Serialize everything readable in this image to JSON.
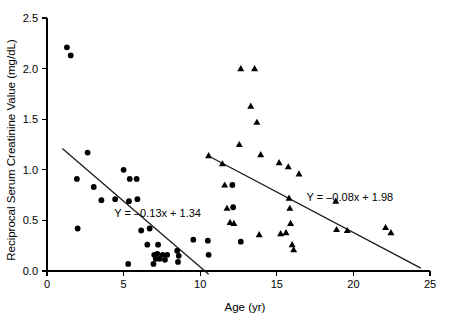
{
  "chart_data": {
    "type": "scatter",
    "title": "",
    "xlabel": "Age (yr)",
    "ylabel": "Reciprocal Serum Creatinine Value (mg/dL)",
    "xlim": [
      0,
      25
    ],
    "ylim": [
      0.0,
      2.5
    ],
    "xticks": [
      0,
      5,
      10,
      15,
      20,
      25
    ],
    "xtick_labels": [
      "0",
      "5",
      "10",
      "15",
      "20",
      "25"
    ],
    "yticks": [
      0.0,
      0.5,
      1.0,
      1.5,
      2.0,
      2.5
    ],
    "ytick_labels": [
      "0.0",
      "0.5",
      "1.0",
      "1.5",
      "2.0",
      "2.5"
    ],
    "grid": false,
    "legend": "none",
    "series": [
      {
        "name": "early-group-circles",
        "marker": "circle",
        "color": "#000000",
        "points": [
          [
            1.3,
            2.21
          ],
          [
            1.55,
            2.13
          ],
          [
            1.95,
            0.91
          ],
          [
            2.0,
            0.42
          ],
          [
            2.65,
            1.17
          ],
          [
            3.05,
            0.83
          ],
          [
            3.55,
            0.7
          ],
          [
            4.45,
            0.71
          ],
          [
            5.0,
            1.0
          ],
          [
            5.3,
            0.07
          ],
          [
            5.35,
            0.69
          ],
          [
            5.4,
            0.91
          ],
          [
            5.85,
            0.91
          ],
          [
            5.9,
            0.71
          ],
          [
            6.15,
            0.4
          ],
          [
            6.55,
            0.26
          ],
          [
            6.7,
            0.42
          ],
          [
            6.95,
            0.07
          ],
          [
            7.0,
            0.16
          ],
          [
            7.1,
            0.12
          ],
          [
            7.2,
            0.17
          ],
          [
            7.25,
            0.26
          ],
          [
            7.35,
            0.12
          ],
          [
            7.55,
            0.16
          ],
          [
            7.7,
            0.11
          ],
          [
            7.85,
            0.16
          ],
          [
            8.5,
            0.2
          ],
          [
            8.55,
            0.09
          ],
          [
            8.6,
            0.15
          ],
          [
            9.55,
            0.31
          ],
          [
            10.5,
            0.3
          ],
          [
            10.55,
            0.16
          ],
          [
            12.1,
            0.85
          ],
          [
            12.15,
            0.63
          ],
          [
            12.65,
            0.29
          ]
        ]
      },
      {
        "name": "late-group-triangles",
        "marker": "triangle",
        "color": "#000000",
        "points": [
          [
            10.55,
            1.14
          ],
          [
            11.45,
            1.06
          ],
          [
            11.6,
            0.85
          ],
          [
            11.75,
            0.62
          ],
          [
            11.95,
            0.48
          ],
          [
            12.2,
            0.47
          ],
          [
            12.55,
            1.25
          ],
          [
            12.65,
            2.0
          ],
          [
            13.3,
            1.63
          ],
          [
            13.55,
            2.0
          ],
          [
            13.7,
            1.47
          ],
          [
            13.85,
            0.36
          ],
          [
            13.95,
            1.15
          ],
          [
            15.15,
            1.07
          ],
          [
            15.25,
            0.37
          ],
          [
            15.6,
            0.38
          ],
          [
            15.75,
            1.03
          ],
          [
            15.8,
            0.72
          ],
          [
            15.85,
            0.62
          ],
          [
            15.9,
            0.47
          ],
          [
            16.0,
            0.26
          ],
          [
            16.1,
            0.21
          ],
          [
            16.45,
            0.96
          ],
          [
            18.85,
            0.69
          ],
          [
            18.9,
            0.41
          ],
          [
            19.6,
            0.4
          ],
          [
            22.1,
            0.43
          ],
          [
            22.45,
            0.38
          ]
        ]
      }
    ],
    "fit_lines": [
      {
        "name": "early-group-fit",
        "equation": "Y = –0.13x + 1.34",
        "slope": -0.13,
        "intercept": 1.34,
        "x_start": 1.0,
        "x_end": 10.55,
        "label_x": 10.05,
        "label_y": 0.53
      },
      {
        "name": "late-group-fit",
        "equation": "Y = –0.08x + 1.98",
        "slope": -0.08,
        "intercept": 1.98,
        "x_start": 10.55,
        "x_end": 24.4,
        "label_x": 22.6,
        "label_y": 0.69
      }
    ]
  }
}
